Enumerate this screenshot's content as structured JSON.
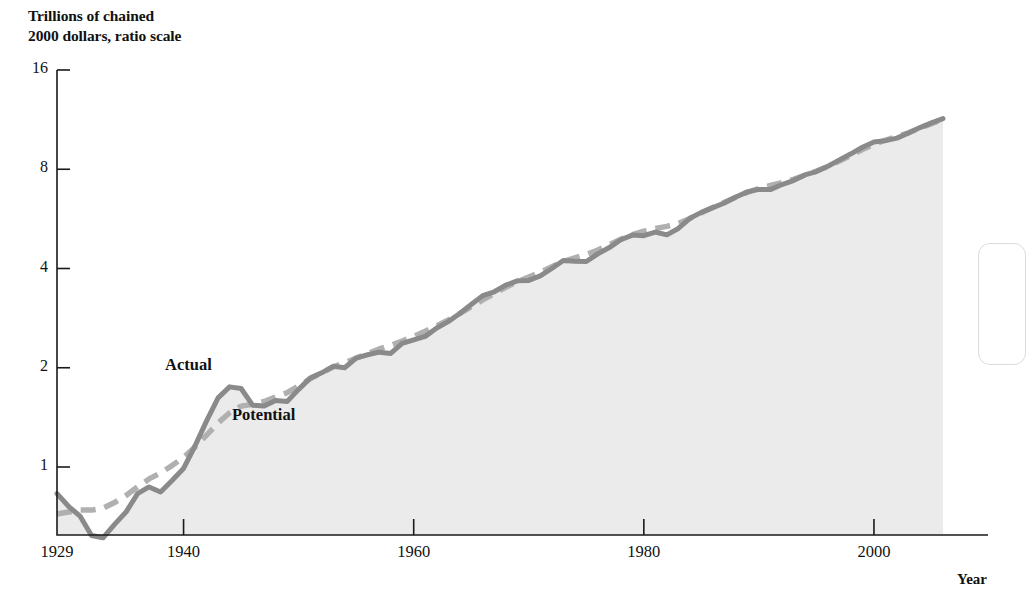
{
  "chart_data": {
    "type": "line",
    "title": "",
    "subtitle": "",
    "ylabel": "Trillions of chained\n2000 dollars, ratio scale",
    "xlabel": "Year",
    "yscale": "log",
    "ylim": [
      0.55,
      16
    ],
    "xlim": [
      1929,
      2006
    ],
    "yticks": [
      16,
      8,
      4,
      2,
      1
    ],
    "ytick_labels": [
      "16",
      "8",
      "4",
      "2",
      "1"
    ],
    "xticks": [
      1929,
      1940,
      1960,
      1980,
      2000
    ],
    "xtick_labels": [
      "1929",
      "1940",
      "1960",
      "1980",
      "2000"
    ],
    "grid": false,
    "legend": "inline-annotations",
    "annotations": [
      {
        "text": "Actual",
        "x": 1942,
        "y": 2.35
      },
      {
        "text": "Potential",
        "x": 1947,
        "y": 1.28
      }
    ],
    "colors": {
      "actual_line": "#8a8a8a",
      "potential_line": "#b0b0b0",
      "fill": "#ebebeb",
      "axis": "#1a1a1a",
      "text": "#111111"
    },
    "series": [
      {
        "name": "Actual",
        "style": "solid",
        "x": [
          1929,
          1930,
          1931,
          1932,
          1933,
          1934,
          1935,
          1936,
          1937,
          1938,
          1939,
          1940,
          1941,
          1942,
          1943,
          1944,
          1945,
          1946,
          1947,
          1948,
          1949,
          1950,
          1951,
          1952,
          1953,
          1954,
          1955,
          1956,
          1957,
          1958,
          1959,
          1960,
          1961,
          1962,
          1963,
          1964,
          1965,
          1966,
          1967,
          1968,
          1969,
          1970,
          1971,
          1972,
          1973,
          1974,
          1975,
          1976,
          1977,
          1978,
          1979,
          1980,
          1981,
          1982,
          1983,
          1984,
          1985,
          1986,
          1987,
          1988,
          1989,
          1990,
          1991,
          1992,
          1993,
          1994,
          1995,
          1996,
          1997,
          1998,
          1999,
          2000,
          2001,
          2002,
          2003,
          2004,
          2005,
          2006
        ],
        "values": [
          0.83,
          0.76,
          0.71,
          0.62,
          0.61,
          0.67,
          0.73,
          0.83,
          0.87,
          0.84,
          0.91,
          0.99,
          1.16,
          1.38,
          1.62,
          1.75,
          1.73,
          1.54,
          1.53,
          1.59,
          1.58,
          1.72,
          1.86,
          1.93,
          2.02,
          2.0,
          2.14,
          2.19,
          2.23,
          2.21,
          2.37,
          2.43,
          2.49,
          2.64,
          2.76,
          2.92,
          3.11,
          3.31,
          3.4,
          3.56,
          3.67,
          3.68,
          3.8,
          4.0,
          4.23,
          4.21,
          4.2,
          4.43,
          4.63,
          4.89,
          5.05,
          5.03,
          5.16,
          5.06,
          5.29,
          5.68,
          5.92,
          6.12,
          6.32,
          6.59,
          6.83,
          6.95,
          6.94,
          7.19,
          7.39,
          7.69,
          7.87,
          8.17,
          8.54,
          8.91,
          9.33,
          9.68,
          9.77,
          9.94,
          10.3,
          10.7,
          11.06,
          11.4
        ]
      },
      {
        "name": "Potential",
        "style": "dashed",
        "x": [
          1929,
          1930,
          1931,
          1932,
          1933,
          1934,
          1935,
          1936,
          1937,
          1938,
          1939,
          1940,
          1941,
          1942,
          1943,
          1944,
          1945,
          1946,
          1947,
          1948,
          1949,
          1950,
          1951,
          1952,
          1953,
          1954,
          1955,
          1956,
          1957,
          1958,
          1959,
          1960,
          1961,
          1962,
          1963,
          1964,
          1965,
          1966,
          1967,
          1968,
          1969,
          1970,
          1971,
          1972,
          1973,
          1974,
          1975,
          1976,
          1977,
          1978,
          1979,
          1980,
          1981,
          1982,
          1983,
          1984,
          1985,
          1986,
          1987,
          1988,
          1989,
          1990,
          1991,
          1992,
          1993,
          1994,
          1995,
          1996,
          1997,
          1998,
          1999,
          2000,
          2001,
          2002,
          2003,
          2004,
          2005,
          2006
        ],
        "values": [
          0.72,
          0.73,
          0.74,
          0.74,
          0.75,
          0.78,
          0.82,
          0.87,
          0.92,
          0.96,
          1.01,
          1.07,
          1.15,
          1.25,
          1.36,
          1.46,
          1.53,
          1.55,
          1.58,
          1.63,
          1.68,
          1.76,
          1.85,
          1.93,
          2.01,
          2.07,
          2.14,
          2.21,
          2.28,
          2.34,
          2.41,
          2.49,
          2.58,
          2.68,
          2.79,
          2.92,
          3.06,
          3.21,
          3.36,
          3.51,
          3.65,
          3.77,
          3.9,
          4.05,
          4.2,
          4.31,
          4.41,
          4.55,
          4.72,
          4.91,
          5.07,
          5.19,
          5.29,
          5.37,
          5.48,
          5.67,
          5.9,
          6.13,
          6.35,
          6.58,
          6.81,
          7.0,
          7.14,
          7.28,
          7.46,
          7.68,
          7.9,
          8.16,
          8.47,
          8.82,
          9.18,
          9.52,
          9.8,
          10.05,
          10.32,
          10.66,
          11.0,
          11.34
        ]
      }
    ]
  },
  "labels": {
    "y_axis_title": "Trillions of chained\n2000 dollars, ratio scale",
    "x_axis_title": "Year",
    "actual": "Actual",
    "potential": "Potential"
  }
}
